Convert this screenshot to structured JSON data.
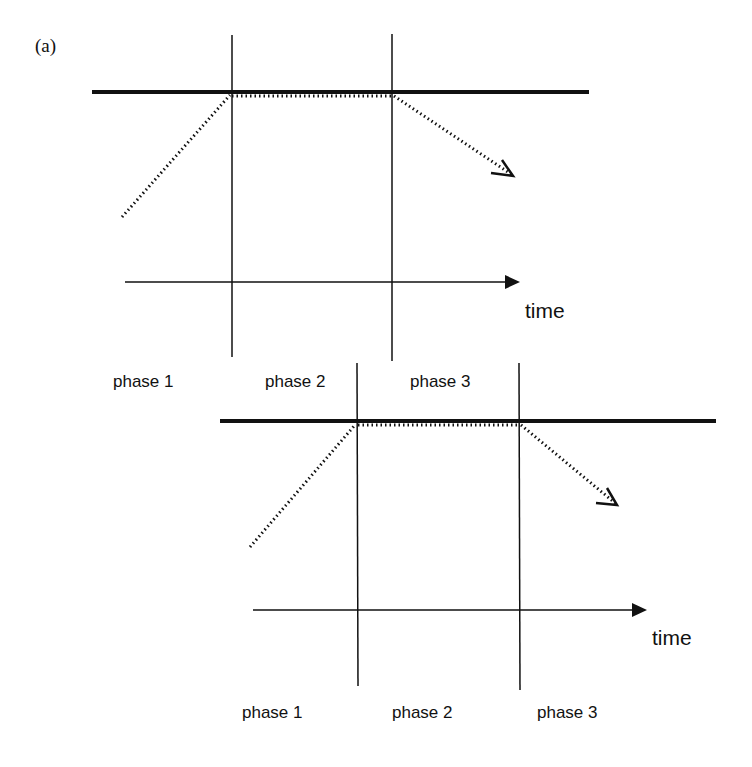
{
  "figure": {
    "panel_label": "(a)",
    "colors": {
      "ink": "#111111",
      "background": "#ffffff"
    },
    "diagrams": [
      {
        "id": "top",
        "axis_label": "time",
        "phases": [
          "phase 1",
          "phase 2",
          "phase 3"
        ]
      },
      {
        "id": "bottom",
        "axis_label": "time",
        "phases": [
          "phase 1",
          "phase 2",
          "phase 3"
        ]
      }
    ],
    "icons": {
      "axis_arrow": "filled-triangle-arrow-icon",
      "trajectory_arrow": "open-chevron-arrow-icon"
    }
  }
}
